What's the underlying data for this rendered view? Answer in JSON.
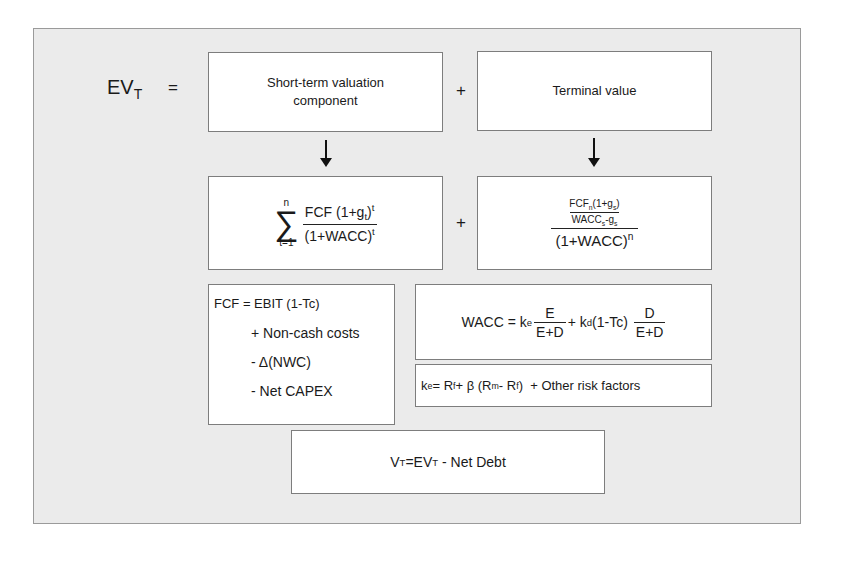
{
  "diagram": {
    "title_lhs": {
      "base": "EV",
      "sub": "T"
    },
    "equals": "=",
    "plus": "+",
    "short_term": {
      "label": "Short-term valuation component",
      "formula": {
        "sum_upper": "n",
        "sum_lower": "t=1",
        "sigma": "∑",
        "numerator": "FCF (1+g",
        "numerator_sub": "t",
        "numerator_close": ")",
        "numerator_sup": "t",
        "denominator": "(1+WACC)",
        "denominator_sup": "t"
      }
    },
    "terminal": {
      "label": "Terminal value",
      "formula": {
        "inner_num_a": "FCF",
        "inner_num_sub": "n",
        "inner_num_b": "(1+g",
        "inner_num_sub2": "s",
        "inner_num_c": ")",
        "inner_den_a": "WACC",
        "inner_den_sub": "s",
        "inner_den_b": "-g",
        "inner_den_sub2": "s",
        "outer_den": "(1+WACC)",
        "outer_den_sup": "n"
      }
    },
    "fcf": {
      "lines": [
        "FCF = EBIT (1-Tc)",
        "+ Non-cash costs",
        "- Δ(NWC)",
        "- Net  CAPEX"
      ]
    },
    "wacc": {
      "lhs": "WACC = k",
      "ke_sub": "e",
      "frac1_num": "E",
      "frac1_den": "E+D",
      "mid": "+ k",
      "kd_sub": "d",
      "mid2": "(1-Tc)",
      "frac2_num": "D",
      "frac2_den": "E+D"
    },
    "ke": {
      "a": "k",
      "a_sub": "e",
      "b": "= R",
      "b_sub": "f",
      "c": " + β (R",
      "c_sub": "m",
      "d": "- R",
      "d_sub": "f",
      "e": ")  + Other risk factors"
    },
    "vt": {
      "a": "V",
      "a_sub": "T",
      "b": "=EV",
      "b_sub": "T",
      "c": " - Net Debt"
    }
  }
}
